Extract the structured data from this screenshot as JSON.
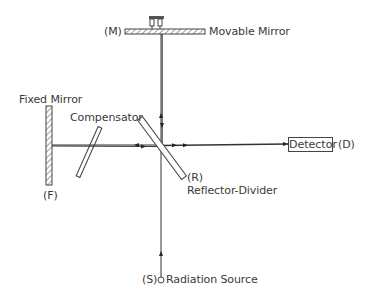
{
  "diagram": {
    "type": "Michelson interferometer schematic",
    "components": {
      "movable_mirror": {
        "label": "Movable Mirror",
        "tag": "(M)"
      },
      "fixed_mirror": {
        "label": "Fixed Mirror",
        "tag": "(F)"
      },
      "compensator": {
        "label": "Compensator"
      },
      "reflector_divider": {
        "label": "Reflector-Divider",
        "tag": "(R)"
      },
      "detector": {
        "label": "Detector",
        "tag": "(D)"
      },
      "radiation_source": {
        "label": "Radiation Source",
        "tag": "(S)"
      }
    },
    "colors": {
      "line": "#333333",
      "background": "#ffffff"
    }
  }
}
